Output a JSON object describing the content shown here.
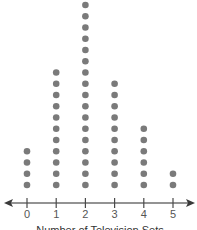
{
  "chart_data": {
    "type": "dot",
    "title": "",
    "xlabel": "Number of Television Sets",
    "ylabel": "",
    "categories": [
      "0",
      "1",
      "2",
      "3",
      "4",
      "5"
    ],
    "values": [
      4,
      11,
      17,
      10,
      6,
      2
    ],
    "xlim": [
      0,
      5
    ],
    "grid": false,
    "legend": null,
    "colors": {
      "dot": "#7a7a7a",
      "axis": "#6f6f6f"
    }
  }
}
